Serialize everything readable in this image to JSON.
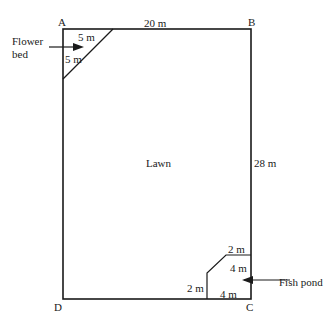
{
  "diagram": {
    "corners": {
      "A": "A",
      "B": "B",
      "C": "C",
      "D": "D"
    },
    "dimensions": {
      "top": "20 m",
      "right": "28 m",
      "flower_bed_top": "5 m",
      "flower_bed_side": "5 m",
      "pond_top": "2 m",
      "pond_right": "4 m",
      "pond_left": "2 m",
      "pond_bottom": "4 m"
    },
    "regions": {
      "lawn": "Lawn",
      "flower_bed_line1": "Flower",
      "flower_bed_line2": "bed",
      "fish_pond": "Fish pond"
    },
    "colors": {
      "line": "#1a1a1a",
      "background": "#ffffff"
    }
  }
}
